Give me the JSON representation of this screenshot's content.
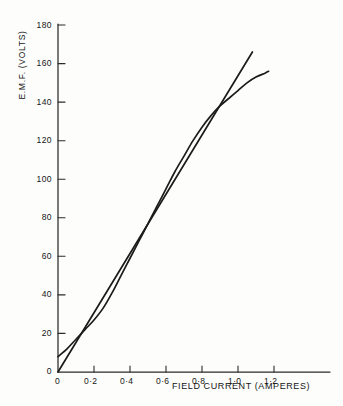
{
  "chart_data": {
    "type": "line",
    "title": "",
    "xlabel": "FIELD CURRENT (AMPERES)",
    "ylabel": "E.M.F. (VOLTS)",
    "xlim": [
      0,
      1.3
    ],
    "ylim": [
      0,
      180
    ],
    "xticks": [
      0,
      0.2,
      0.4,
      0.6,
      0.8,
      1.0,
      1.2
    ],
    "xticklabels": [
      "0",
      "0·2",
      "0·4",
      "0·6",
      "0·8",
      "1·0",
      "1·2"
    ],
    "yticks": [
      0,
      20,
      40,
      60,
      80,
      100,
      120,
      140,
      160,
      180
    ],
    "yticklabels": [
      "0",
      "20",
      "40",
      "60",
      "80",
      "100",
      "120",
      "140",
      "160",
      "180"
    ],
    "grid": false,
    "legend": "none",
    "line_color": "#1b1b1b",
    "axis_color": "#2a2a2a",
    "series": [
      {
        "name": "open-circuit-characteristic",
        "type": "curve",
        "x": [
          0.0,
          0.05,
          0.1,
          0.15,
          0.2,
          0.25,
          0.3,
          0.35,
          0.4,
          0.45,
          0.5,
          0.55,
          0.6,
          0.65,
          0.7,
          0.75,
          0.8,
          0.85,
          0.9,
          0.95,
          1.0,
          1.05,
          1.1,
          1.15,
          1.17
        ],
        "y": [
          8,
          12,
          17,
          22,
          27,
          33,
          41,
          50,
          59,
          68,
          77,
          86,
          95,
          104,
          112,
          120,
          127,
          133,
          138,
          142,
          146,
          150,
          153,
          155,
          156
        ]
      },
      {
        "name": "field-resistance-line",
        "type": "straight",
        "x": [
          0.0,
          1.08
        ],
        "y": [
          0,
          166
        ]
      }
    ],
    "annotations": {
      "crossing_point": {
        "x": 0.95,
        "y": 141
      },
      "residual_emf": 8
    }
  }
}
